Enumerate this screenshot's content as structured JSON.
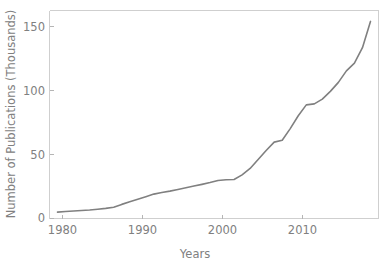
{
  "chart_data": {
    "type": "line",
    "title": "",
    "xlabel": "Years",
    "ylabel": "Number of Publications (Thousands)",
    "xlim": [
      1979,
      2020
    ],
    "ylim": [
      0,
      162
    ],
    "xticks": [
      1980,
      1990,
      2000,
      2010
    ],
    "yticks": [
      0,
      50,
      100,
      150
    ],
    "xtick_labels": [
      "1980",
      "1990",
      "2000",
      "2010"
    ],
    "ytick_labels": [
      "0",
      "50",
      "100",
      "150"
    ],
    "grid": false,
    "legend": null,
    "series": [
      {
        "name": "Number of Publications (Thousands)",
        "color": "#808080",
        "x": [
          1980,
          1981,
          1982,
          1983,
          1984,
          1985,
          1986,
          1987,
          1988,
          1989,
          1990,
          1991,
          1992,
          1993,
          1994,
          1995,
          1996,
          1997,
          1998,
          1999,
          2000,
          2001,
          2002,
          2003,
          2004,
          2005,
          2006,
          2007,
          2008,
          2009,
          2010,
          2011,
          2012,
          2013,
          2014,
          2015,
          2016,
          2017,
          2018,
          2019
        ],
        "values": [
          5.0,
          5.4,
          5.8,
          6.2,
          6.6,
          7.2,
          7.9,
          8.8,
          11.0,
          13.0,
          15.0,
          17.0,
          19.0,
          20.2,
          21.3,
          22.6,
          24.0,
          25.3,
          26.6,
          28.0,
          29.6,
          30.2,
          30.4,
          34.0,
          39.0,
          46.0,
          53.0,
          59.5,
          61.0,
          70.0,
          80.0,
          88.5,
          89.3,
          93.0,
          99.0,
          106.0,
          115.0,
          121.0,
          133.0,
          153.5
        ]
      }
    ]
  },
  "axes": {
    "ylabel_text": "Number of Publications (Thousands)",
    "xlabel_text": "Years"
  }
}
